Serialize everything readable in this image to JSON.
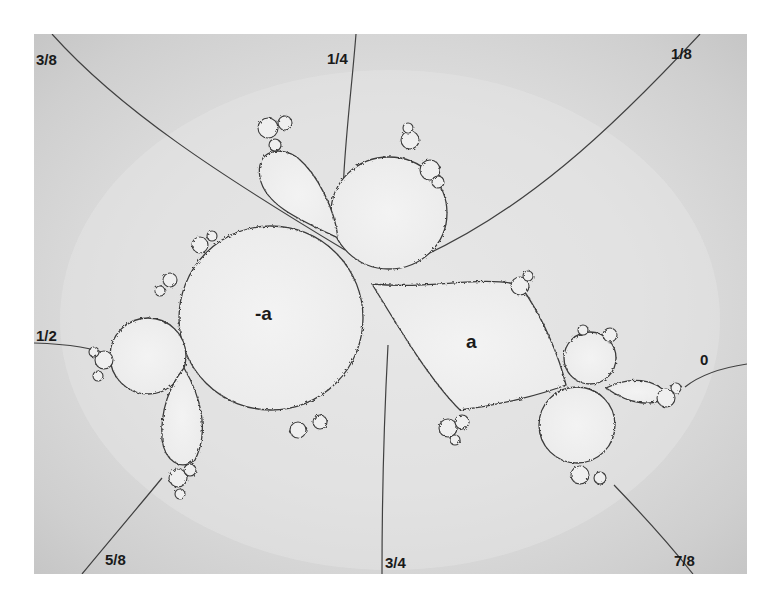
{
  "diagram": {
    "type": "julia-set-external-rays",
    "background_color": "#c9c9c9",
    "set_fill_color": "#ececec",
    "outline_color": "#3a3a3a",
    "ray_color": "#404040",
    "region_labels": [
      {
        "id": "minus-a",
        "text": "-a"
      },
      {
        "id": "a",
        "text": "a"
      }
    ],
    "rays": [
      {
        "id": "ray-0",
        "angle": "0"
      },
      {
        "id": "ray-1-8",
        "angle": "1/8"
      },
      {
        "id": "ray-1-4",
        "angle": "1/4"
      },
      {
        "id": "ray-3-8",
        "angle": "3/8"
      },
      {
        "id": "ray-1-2",
        "angle": "1/2"
      },
      {
        "id": "ray-5-8",
        "angle": "5/8"
      },
      {
        "id": "ray-3-4",
        "angle": "3/4"
      },
      {
        "id": "ray-7-8",
        "angle": "7/8"
      }
    ]
  }
}
